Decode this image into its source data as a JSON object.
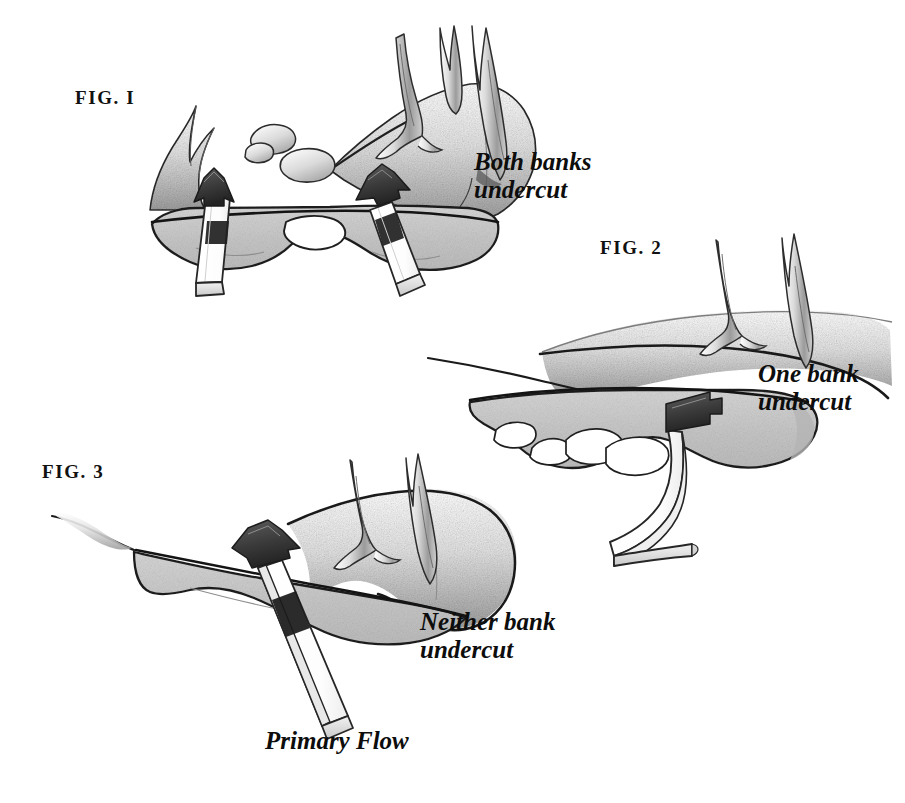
{
  "plate": {
    "title": "Stream bank undercut diagrams",
    "background_color": "#ffffff",
    "ink_color": "#111111"
  },
  "figures": [
    {
      "id": "fig-1",
      "label": "FIG.  I",
      "callout": "Both banks\nundercut",
      "description": "Stream cross-section with both banks undercut; two vertical flow ribbons with dark arrowheads rise through the water surface; three rocks rest above the channel.",
      "banks_undercut": "both",
      "arrow_count": 2,
      "rock_count": 3,
      "tree_count": 3
    },
    {
      "id": "fig-2",
      "label": "FIG.  2",
      "callout": "One bank\nundercut",
      "description": "Stream cross-section with only the right bank undercut; a single S-curved flow ribbon sweeps sideways into the undercut bank.",
      "banks_undercut": "one",
      "arrow_count": 1,
      "rock_count": 4,
      "tree_count": 2
    },
    {
      "id": "fig-3",
      "label": "FIG.  3",
      "callout": "Neither bank\nundercut",
      "caption": "Primary Flow",
      "description": "Stream cross-section with neither bank undercut; a straight flow ribbon rises at an angle and breaks the water surface.",
      "banks_undercut": "neither",
      "arrow_count": 1,
      "rock_count": 0,
      "tree_count": 2
    }
  ],
  "captions": {
    "primary_flow": "Primary Flow"
  },
  "palette": {
    "paper": "#ffffff",
    "ink": "#111111",
    "water_fill": "#c9c9c9",
    "water_fill_light": "#d8d8d8",
    "bank_fill": "#e6e6e6",
    "grass_shade": "#b5b5b5",
    "arrow_dark": "#3a3a3a",
    "arrow_darkest": "#1d1d1d",
    "ribbon_fill": "#ffffff",
    "ribbon_edge": "#c2c2c2",
    "rock_fill": "#dcdcdc"
  }
}
